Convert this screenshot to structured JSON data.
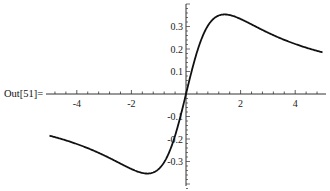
{
  "output_label": "Out[51]=",
  "chart_data": {
    "type": "line",
    "title": "",
    "xlabel": "",
    "ylabel": "",
    "function_approx": "x/(2+x^2)",
    "xlim": [
      -5,
      5
    ],
    "ylim": [
      -0.37,
      0.37
    ],
    "x_ticks": [
      -4,
      -2,
      2,
      4
    ],
    "x_tick_labels": [
      "-4",
      "-2",
      "2",
      "4"
    ],
    "y_ticks": [
      0.3,
      0.2,
      0.1,
      -0.1,
      -0.2,
      -0.3
    ],
    "y_tick_labels": [
      "0.3",
      "0.2",
      "0.1",
      "-0.1",
      "-0.2",
      "-0.3"
    ],
    "grid": false,
    "series": [
      {
        "name": "f(x)",
        "x": [
          -5,
          -4,
          -3,
          -2,
          -1.414,
          -1,
          -0.5,
          0,
          0.5,
          1,
          1.414,
          2,
          3,
          4,
          5
        ],
        "values": [
          -0.185,
          -0.222,
          -0.273,
          -0.333,
          -0.354,
          -0.333,
          -0.222,
          0,
          0.222,
          0.333,
          0.354,
          0.333,
          0.273,
          0.222,
          0.185
        ]
      }
    ]
  },
  "colors": {
    "curve": "#111111",
    "axis": "#333333",
    "text": "#222222"
  }
}
